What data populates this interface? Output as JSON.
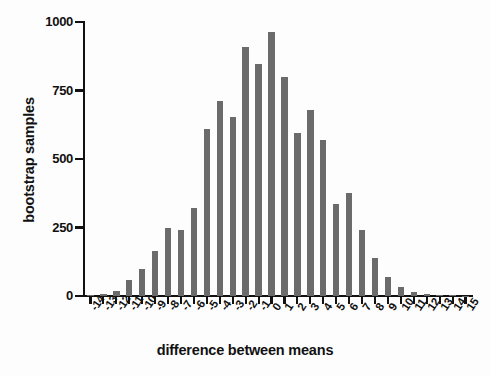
{
  "chart_data": {
    "type": "bar",
    "title": "",
    "subtitle": "",
    "xlabel": "difference between means",
    "ylabel": "bootstrap samples",
    "categories": [
      "-14",
      "-13",
      "-12",
      "-11",
      "-10",
      "-9",
      "-8",
      "-7",
      "-6",
      "-5",
      "-4",
      "-3",
      "-2",
      "-1",
      "0",
      "1",
      "2",
      "3",
      "4",
      "5",
      "6",
      "7",
      "8",
      "9",
      "10",
      "11",
      "12",
      "13",
      "14",
      "15"
    ],
    "values": [
      4,
      8,
      18,
      60,
      100,
      165,
      250,
      240,
      320,
      610,
      710,
      655,
      910,
      845,
      965,
      800,
      595,
      680,
      570,
      335,
      375,
      240,
      140,
      70,
      32,
      14,
      6,
      3,
      2,
      1
    ],
    "xlim": [
      -14,
      15
    ],
    "ylim": [
      0,
      1000
    ],
    "yticks": [
      0,
      250,
      500,
      750,
      1000
    ],
    "ytick_labels": [
      "0",
      "250",
      "500",
      "750",
      "1000"
    ],
    "grid": false,
    "legend": false,
    "bar_color": "#6b6b6b",
    "axis_color": "#111111",
    "background_color": "#ffffff"
  },
  "axes": {
    "y_title": "bootstrap samples",
    "x_title": "difference between means"
  }
}
